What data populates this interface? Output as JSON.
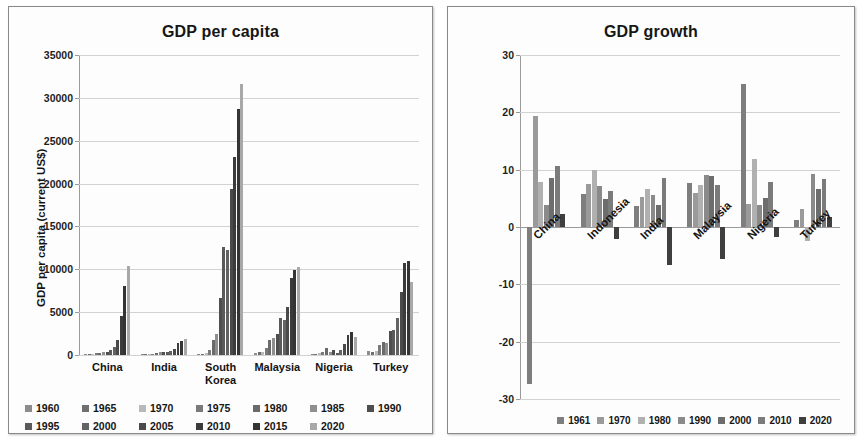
{
  "left": {
    "title": "GDP per capita",
    "ylabel": "GDP per capita (current US$)",
    "categories": [
      "China",
      "India",
      "South Korea",
      "Malaysia",
      "Nigeria",
      "Turkey"
    ],
    "yticks": [
      "0",
      "5000",
      "10000",
      "15000",
      "20000",
      "25000",
      "30000",
      "35000"
    ],
    "legend": [
      "1960",
      "1965",
      "1970",
      "1975",
      "1980",
      "1985",
      "1990",
      "1995",
      "2000",
      "2005",
      "2010",
      "2015",
      "2020"
    ]
  },
  "right": {
    "title": "GDP growth",
    "ylabel": "Annual Growth in GDP (%)",
    "categories": [
      "China",
      "Indonesia",
      "India",
      "Malaysia",
      "Nigeria",
      "Turkey"
    ],
    "yticks": [
      "-30",
      "-20",
      "10",
      "0",
      "10",
      "20",
      "30"
    ],
    "legend": [
      "1961",
      "1970",
      "1980",
      "1990",
      "2000",
      "2010",
      "2020"
    ]
  },
  "chart_data": [
    {
      "type": "bar",
      "title": "GDP per capita",
      "xlabel": "",
      "ylabel": "GDP per capita (current US$)",
      "ylim": [
        0,
        35000
      ],
      "ytick_step": 5000,
      "grid": true,
      "legend_position": "bottom",
      "categories": [
        "China",
        "India",
        "South Korea",
        "Malaysia",
        "Nigeria",
        "Turkey"
      ],
      "series": [
        {
          "name": "1960",
          "color": "#8c8c8c",
          "values": [
            90,
            82,
            158,
            235,
            93,
            509
          ]
        },
        {
          "name": "1965",
          "color": "#6f6f6f",
          "values": [
            98,
            119,
            109,
            332,
            117,
            388
          ]
        },
        {
          "name": "1970",
          "color": "#b9b9b9",
          "values": [
            113,
            112,
            279,
            394,
            224,
            483
          ]
        },
        {
          "name": "1975",
          "color": "#7a7a7a",
          "values": [
            178,
            158,
            617,
            765,
            313,
            1118
          ]
        },
        {
          "name": "1980",
          "color": "#6a6a6a",
          "values": [
            195,
            267,
            1715,
            1775,
            874,
            1564
          ]
        },
        {
          "name": "1985",
          "color": "#8f8f8f",
          "values": [
            294,
            303,
            2482,
            2000,
            410,
            1378
          ]
        },
        {
          "name": "1990",
          "color": "#4e4e4e",
          "values": [
            318,
            368,
            6610,
            2442,
            568,
            2794
          ]
        },
        {
          "name": "1995",
          "color": "#5a5a5a",
          "values": [
            609,
            374,
            12565,
            4330,
            260,
            2911
          ]
        },
        {
          "name": "2000",
          "color": "#636363",
          "values": [
            959,
            443,
            12257,
            4044,
            568,
            4338
          ]
        },
        {
          "name": "2005",
          "color": "#4a4a4a",
          "values": [
            1753,
            714,
            19402,
            5587,
            1251,
            7384
          ]
        },
        {
          "name": "2010",
          "color": "#3b3b3b",
          "values": [
            4550,
            1358,
            23087,
            9041,
            2292,
            10743
          ]
        },
        {
          "name": "2015",
          "color": "#343434",
          "values": [
            8016,
            1606,
            28732,
            9955,
            2730,
            11006
          ]
        },
        {
          "name": "2020",
          "color": "#a8a8a8",
          "values": [
            10409,
            1913,
            31631,
            10270,
            2097,
            8536
          ]
        }
      ]
    },
    {
      "type": "bar",
      "title": "GDP growth",
      "xlabel": "",
      "ylabel": "Annual Growth in GDP (%)",
      "ylim": [
        -30,
        30
      ],
      "ytick_step": 10,
      "grid": true,
      "legend_position": "bottom",
      "categories": [
        "China",
        "Indonesia",
        "India",
        "Malaysia",
        "Nigeria",
        "Turkey"
      ],
      "series": [
        {
          "name": "1961",
          "color": "#7e7e7e",
          "values": [
            -27.3,
            5.7,
            3.7,
            7.6,
            25.0,
            1.2
          ]
        },
        {
          "name": "1970",
          "color": "#9a9a9a",
          "values": [
            19.3,
            7.5,
            5.2,
            6.0,
            4.1,
            3.2
          ]
        },
        {
          "name": "1980",
          "color": "#b0b0b0",
          "values": [
            7.8,
            9.9,
            6.7,
            7.4,
            11.8,
            -2.4
          ]
        },
        {
          "name": "1990",
          "color": "#8a8a8a",
          "values": [
            3.9,
            7.2,
            5.5,
            9.0,
            3.9,
            9.3
          ]
        },
        {
          "name": "2000",
          "color": "#6d6d6d",
          "values": [
            8.5,
            4.9,
            3.8,
            8.9,
            5.0,
            6.6
          ]
        },
        {
          "name": "2010",
          "color": "#7b7b7b",
          "values": [
            10.6,
            6.2,
            8.5,
            7.4,
            7.8,
            8.4
          ]
        },
        {
          "name": "2020",
          "color": "#3f3f3f",
          "values": [
            2.2,
            -2.1,
            -6.6,
            -5.5,
            -1.8,
            1.8
          ]
        }
      ]
    }
  ]
}
